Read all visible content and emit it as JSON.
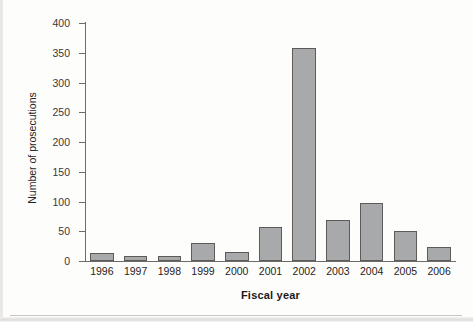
{
  "chart_data": {
    "type": "bar",
    "title": "",
    "subtitle": "",
    "xlabel": "Fiscal year",
    "ylabel": "Number of prosecutions",
    "categories": [
      "1996",
      "1997",
      "1998",
      "1999",
      "2000",
      "2001",
      "2002",
      "2003",
      "2004",
      "2005",
      "2006"
    ],
    "values": [
      14,
      9,
      8,
      31,
      15,
      58,
      358,
      69,
      97,
      51,
      24
    ],
    "ylim": [
      0,
      400
    ],
    "ytick_labels": [
      "0",
      "50",
      "100",
      "150",
      "200",
      "250",
      "300",
      "350",
      "400"
    ],
    "ytick_values": [
      0,
      50,
      100,
      150,
      200,
      250,
      300,
      350,
      400
    ],
    "grid": false,
    "legend": null,
    "legend_position": "none",
    "series": [
      {
        "name": "Number of prosecutions",
        "values": [
          14,
          9,
          8,
          31,
          15,
          58,
          358,
          69,
          97,
          51,
          24
        ]
      }
    ],
    "colors": {
      "bar_fill": "#a7a9ab",
      "bar_stroke": "#5d5a58",
      "axis": "#6e6b68",
      "text": "#262321",
      "background": "#ffffff"
    }
  }
}
